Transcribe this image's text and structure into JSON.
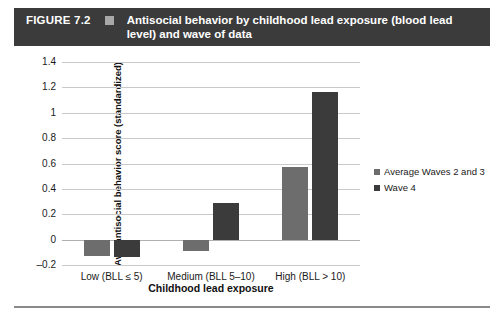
{
  "figure": {
    "label": "FIGURE 7.2",
    "title": "Antisocial behavior by childhood lead exposure (blood lead level) and wave of data",
    "marker_icon": "square-marker",
    "banner_color": "#3b3b3b",
    "marker_color": "#a8a8a8"
  },
  "chart_data": {
    "type": "bar",
    "title": "Antisocial behavior by childhood lead exposure (blood lead level) and wave of data",
    "categories": [
      "Low (BLL ≤ 5)",
      "Medium (BLL 5–10)",
      "High (BLL > 10)"
    ],
    "series": [
      {
        "name": "Average Waves 2 and 3",
        "color": "#6d6d6d",
        "values": [
          -0.13,
          -0.09,
          0.57
        ]
      },
      {
        "name": "Wave 4",
        "color": "#3b3b3b",
        "values": [
          -0.14,
          0.29,
          1.16
        ]
      }
    ],
    "xlabel": "Childhood lead exposure",
    "ylabel": "Ave, antisocial behavior score (standardized)",
    "ylim": [
      -0.2,
      1.4
    ],
    "yticks": [
      "1.4",
      "1.2",
      "1",
      "0.8",
      "0.6",
      "0.4",
      "0.2",
      "0",
      "-0.2"
    ],
    "ytick_values": [
      1.4,
      1.2,
      1,
      0.8,
      0.6,
      0.4,
      0.2,
      0,
      -0.2
    ],
    "grid": true,
    "legend_position": "right"
  }
}
